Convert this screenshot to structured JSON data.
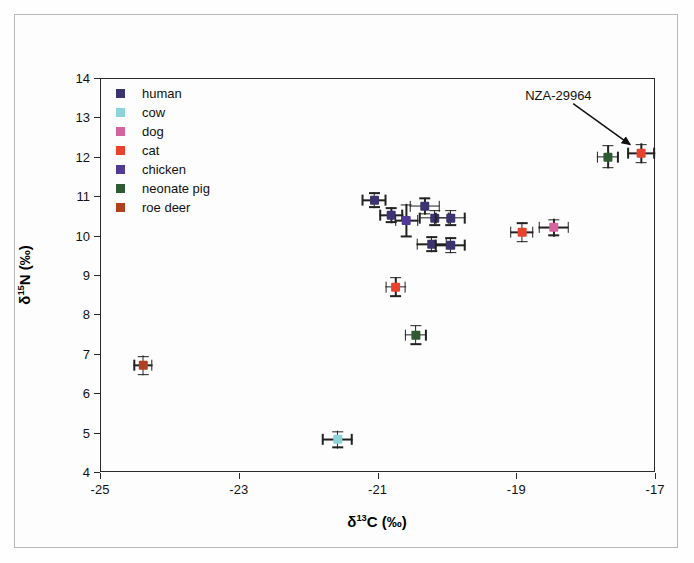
{
  "figure": {
    "background": "#fefefe",
    "frame_color": "#b9b9b9"
  },
  "axes": {
    "x_label_html": "&delta;<sup>13</sup>C (&permil;)",
    "y_label_html": "&delta;<sup>15</sup>N (&permil;)",
    "x_label_text": "δ13C (‰)",
    "y_label_text": "δ15N (‰)",
    "x_ticks": [
      "-25",
      "-23",
      "-21",
      "-19",
      "-17"
    ],
    "y_ticks": [
      "14",
      "13",
      "12",
      "11",
      "10",
      "9",
      "8",
      "7",
      "6",
      "5",
      "4"
    ]
  },
  "legend": {
    "items": [
      {
        "label": "human",
        "color": "#3b3471"
      },
      {
        "label": "cow",
        "color": "#8ed3d8"
      },
      {
        "label": "dog",
        "color": "#d463a0"
      },
      {
        "label": "cat",
        "color": "#e8422c"
      },
      {
        "label": "chicken",
        "color": "#513a96"
      },
      {
        "label": "neonate pig",
        "color": "#2f5b33"
      },
      {
        "label": "roe deer",
        "color": "#b1401f"
      }
    ]
  },
  "annotation": {
    "label": "NZA-29964",
    "target_series": "cat"
  },
  "chart_data": {
    "type": "scatter",
    "title": "",
    "xlabel": "δ13C (‰)",
    "ylabel": "δ15N (‰)",
    "xlim": [
      -25,
      -17
    ],
    "ylim": [
      4,
      14
    ],
    "xticks": [
      -25,
      -23,
      -21,
      -19,
      -17
    ],
    "yticks": [
      4,
      5,
      6,
      7,
      8,
      9,
      10,
      11,
      12,
      13,
      14
    ],
    "grid": false,
    "legend_position": "top-left-inside",
    "error_bars": "both x and y",
    "series": [
      {
        "name": "human",
        "color": "#3b3471",
        "points": [
          {
            "x": -21.05,
            "y": 10.9,
            "xerr": 0.18,
            "yerr": 0.2
          },
          {
            "x": -20.8,
            "y": 10.52,
            "xerr": 0.17,
            "yerr": 0.2
          },
          {
            "x": -20.32,
            "y": 10.75,
            "xerr": 0.22,
            "yerr": 0.22
          },
          {
            "x": -20.18,
            "y": 10.45,
            "xerr": 0.22,
            "yerr": 0.2
          },
          {
            "x": -19.95,
            "y": 10.45,
            "xerr": 0.22,
            "yerr": 0.2
          },
          {
            "x": -20.22,
            "y": 9.78,
            "xerr": 0.22,
            "yerr": 0.2
          },
          {
            "x": -19.95,
            "y": 9.75,
            "xerr": 0.22,
            "yerr": 0.2
          }
        ]
      },
      {
        "name": "cow",
        "color": "#8ed3d8",
        "points": [
          {
            "x": -21.58,
            "y": 4.82,
            "xerr": 0.22,
            "yerr": 0.22
          }
        ]
      },
      {
        "name": "dog",
        "color": "#d463a0",
        "points": [
          {
            "x": -18.46,
            "y": 10.2,
            "xerr": 0.22,
            "yerr": 0.22
          }
        ]
      },
      {
        "name": "cat",
        "color": "#e8422c",
        "points": [
          {
            "x": -20.74,
            "y": 8.7,
            "xerr": 0.15,
            "yerr": 0.25
          },
          {
            "x": -18.92,
            "y": 10.08,
            "xerr": 0.17,
            "yerr": 0.25
          },
          {
            "x": -17.2,
            "y": 12.08,
            "xerr": 0.2,
            "yerr": 0.25
          }
        ]
      },
      {
        "name": "chicken",
        "color": "#513a96",
        "points": [
          {
            "x": -20.58,
            "y": 10.38,
            "xerr": 0.17,
            "yerr": 0.42
          }
        ]
      },
      {
        "name": "neonate pig",
        "color": "#2f5b33",
        "points": [
          {
            "x": -20.45,
            "y": 7.48,
            "xerr": 0.16,
            "yerr": 0.25
          },
          {
            "x": -17.68,
            "y": 12.0,
            "xerr": 0.16,
            "yerr": 0.3
          }
        ]
      },
      {
        "name": "roe deer",
        "color": "#b1401f",
        "points": [
          {
            "x": -24.38,
            "y": 6.7,
            "xerr": 0.14,
            "yerr": 0.25
          }
        ]
      }
    ],
    "annotations": [
      {
        "text": "NZA-29964",
        "points_to_x": -17.2,
        "points_to_y": 12.08
      }
    ]
  }
}
